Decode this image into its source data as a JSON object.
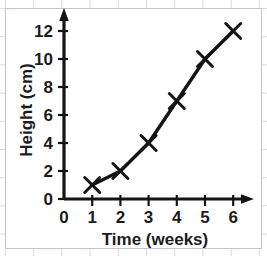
{
  "chart_data": {
    "type": "line",
    "title": "",
    "xlabel": "Time (weeks)",
    "ylabel": "Height (cm)",
    "x": [
      1,
      2,
      3,
      4,
      5,
      6
    ],
    "values": [
      1,
      2,
      4,
      7,
      10,
      12
    ],
    "series": [
      {
        "name": "Height",
        "x": [
          1,
          2,
          3,
          4,
          5,
          6
        ],
        "values": [
          1,
          2,
          4,
          7,
          10,
          12
        ]
      }
    ],
    "xlim": [
      0,
      6.6
    ],
    "ylim": [
      0,
      13.2
    ],
    "x_ticks": [
      0,
      1,
      2,
      3,
      4,
      5,
      6
    ],
    "y_ticks": [
      0,
      2,
      4,
      6,
      8,
      10,
      12
    ],
    "x_tick_labels": [
      "0",
      "1",
      "2",
      "3",
      "4",
      "5",
      "6"
    ],
    "y_tick_labels": [
      "0",
      "2",
      "4",
      "6",
      "8",
      "10",
      "12"
    ],
    "grid": true,
    "legend": false,
    "marker": "x",
    "line_color": "#141414",
    "grid_color": "#d8dade",
    "axis_color": "#141414"
  },
  "axes": {
    "x_title": "Time (weeks)",
    "y_title": "Height (cm)"
  },
  "ticks": {
    "x": [
      "0",
      "1",
      "2",
      "3",
      "4",
      "5",
      "6"
    ],
    "y": [
      "0",
      "2",
      "4",
      "6",
      "8",
      "10",
      "12"
    ]
  }
}
